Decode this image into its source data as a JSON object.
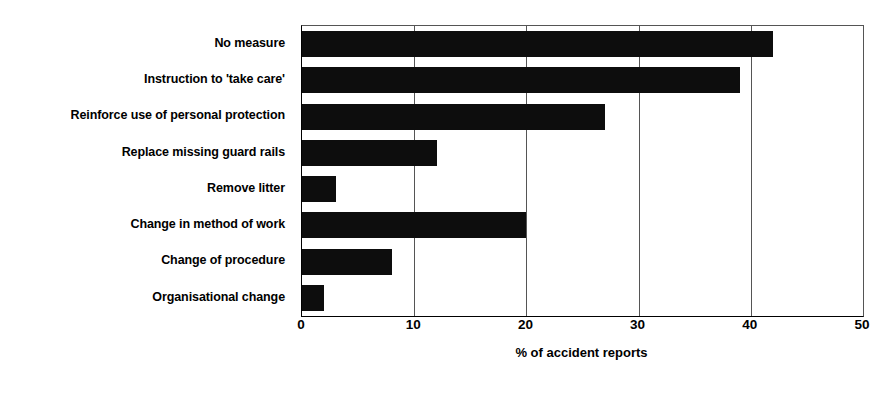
{
  "chart_data": {
    "type": "bar",
    "orientation": "horizontal",
    "title": "",
    "xlabel": "% of accident reports",
    "ylabel": "",
    "categories": [
      "No measure",
      "Instruction to 'take care'",
      "Reinforce use of personal protection",
      "Replace missing guard rails",
      "Remove litter",
      "Change in method of work",
      "Change of procedure",
      "Organisational change"
    ],
    "values": [
      42,
      39,
      27,
      12,
      3,
      20,
      8,
      2
    ],
    "xlim": [
      0,
      50
    ],
    "xticks": [
      0,
      10,
      20,
      30,
      40,
      50
    ],
    "xtick_labels": [
      "0",
      "10",
      "20",
      "30",
      "40",
      "50"
    ],
    "grid": "vertical-only",
    "legend": "none",
    "bar_color": "#0d0d0d",
    "background_color": "#ffffff",
    "axis_color": "#000000"
  }
}
